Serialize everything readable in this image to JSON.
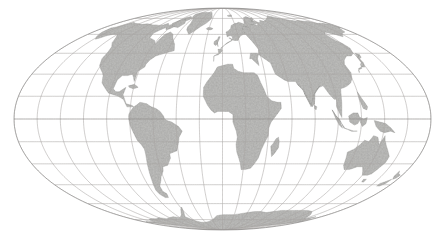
{
  "figure": {
    "kind": "world-map",
    "projection": "Mollweide",
    "background_color": "#ffffff",
    "land_color": "#a9a9a7",
    "land_outline_color": "#6f6e6c",
    "ocean_color": "#ffffff",
    "graticule_color": "#a8a6a4",
    "border_rule_color": "#d9d9d9"
  },
  "graticule": {
    "meridian_interval_deg": 20,
    "parallel_interval_deg": 15,
    "meridians_deg": [
      -180,
      -160,
      -140,
      -120,
      -100,
      -80,
      -60,
      -40,
      -20,
      0,
      20,
      40,
      60,
      80,
      100,
      120,
      140,
      160,
      180
    ],
    "parallels_deg": [
      -75,
      -60,
      -45,
      -30,
      -15,
      0,
      15,
      30,
      45,
      60,
      75
    ],
    "central_meridian_deg": 0
  },
  "extent": {
    "left_px": 14,
    "right_px": 431,
    "top_px": 8,
    "bottom_px": 230,
    "lon_range_deg": [
      -180,
      180
    ],
    "lat_range_deg": [
      -90,
      90
    ]
  },
  "rules": {
    "top_y_px": 5,
    "bottom_y_px": 233
  },
  "landmasses": [
    "North America",
    "South America",
    "Africa",
    "Europe",
    "Asia",
    "Australia",
    "Antarctica",
    "Greenland",
    "Madagascar",
    "Japan",
    "New Zealand",
    "British Isles",
    "Indonesia"
  ]
}
